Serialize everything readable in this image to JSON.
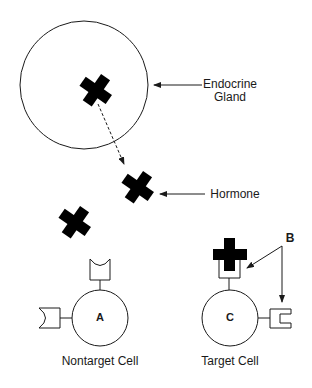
{
  "diagram": {
    "labels": {
      "gland": "Endocrine\nGland",
      "gland_line1": "Endocrine",
      "gland_line2": "Gland",
      "hormone": "Hormone",
      "receptor_pointer": "B",
      "nontarget_cell_letter": "A",
      "target_cell_letter": "C",
      "nontarget_cell": "Nontarget Cell",
      "target_cell": "Target Cell"
    },
    "nodes": [
      {
        "id": "gland",
        "shape": "circle",
        "label": "Endocrine Gland"
      },
      {
        "id": "hormone-in-gland",
        "shape": "cross"
      },
      {
        "id": "hormone-released",
        "shape": "cross",
        "label": "Hormone"
      },
      {
        "id": "hormone-free",
        "shape": "cross"
      },
      {
        "id": "cell-a",
        "shape": "circle",
        "label": "Nontarget Cell",
        "letter": "A",
        "receptors": [
          "rounded-cup (top)",
          "rounded-cup (left)"
        ]
      },
      {
        "id": "cell-c",
        "shape": "circle",
        "label": "Target Cell",
        "letter": "C",
        "receptors": [
          "square-cup with bound hormone (top)",
          "square-cup (right)"
        ]
      }
    ],
    "edges": [
      {
        "from": "hormone-in-gland",
        "to": "hormone-released",
        "style": "dashed-arrow"
      },
      {
        "from": "label-gland",
        "to": "gland",
        "style": "arrow"
      },
      {
        "from": "label-hormone",
        "to": "hormone-released",
        "style": "arrow"
      },
      {
        "from": "label-B",
        "to": "cell-c top receptor",
        "style": "arrow"
      },
      {
        "from": "label-B",
        "to": "cell-c right receptor",
        "style": "arrow"
      }
    ],
    "colors": {
      "line": "#1a1a1a",
      "fill": "#000000",
      "background": "#ffffff"
    }
  }
}
